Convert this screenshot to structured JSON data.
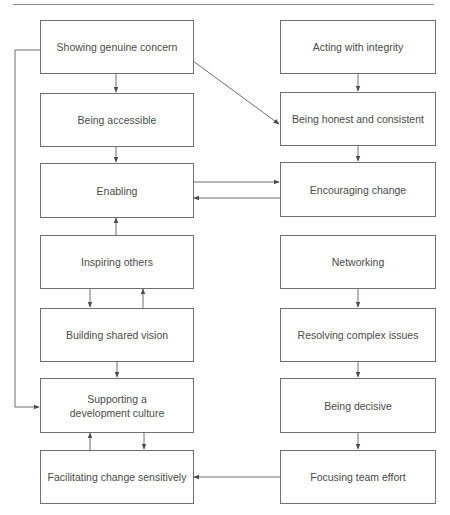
{
  "diagram": {
    "type": "flowchart",
    "colors": {
      "line": "#6f6f6f",
      "text": "#4a4a4a",
      "background": "#ffffff"
    },
    "left_column": [
      {
        "id": "L1",
        "label": "Showing genuine concern"
      },
      {
        "id": "L2",
        "label": "Being accessible"
      },
      {
        "id": "L3",
        "label": "Enabling"
      },
      {
        "id": "L4",
        "label": "Inspiring others"
      },
      {
        "id": "L5",
        "label": "Building shared vision"
      },
      {
        "id": "L6",
        "label": "Supporting a development culture"
      },
      {
        "id": "L7",
        "label": "Facilitating change sensitively"
      }
    ],
    "right_column": [
      {
        "id": "R1",
        "label": "Acting with integrity"
      },
      {
        "id": "R2",
        "label": "Being honest and consistent"
      },
      {
        "id": "R3",
        "label": "Encouraging change"
      },
      {
        "id": "R4",
        "label": "Networking"
      },
      {
        "id": "R5",
        "label": "Resolving complex issues"
      },
      {
        "id": "R6",
        "label": "Being decisive"
      },
      {
        "id": "R7",
        "label": "Focusing team effort"
      }
    ],
    "edges": [
      {
        "from": "L1",
        "to": "L2"
      },
      {
        "from": "L1",
        "to": "R2"
      },
      {
        "from": "L1",
        "to": "L6"
      },
      {
        "from": "L2",
        "to": "L3"
      },
      {
        "from": "L3",
        "to": "R3"
      },
      {
        "from": "R3",
        "to": "L3"
      },
      {
        "from": "L4",
        "to": "L3"
      },
      {
        "from": "L4",
        "to": "L5"
      },
      {
        "from": "L5",
        "to": "L4"
      },
      {
        "from": "L5",
        "to": "L6"
      },
      {
        "from": "L6",
        "to": "L7"
      },
      {
        "from": "L7",
        "to": "L6"
      },
      {
        "from": "R1",
        "to": "R2"
      },
      {
        "from": "R2",
        "to": "R3"
      },
      {
        "from": "R4",
        "to": "R5"
      },
      {
        "from": "R5",
        "to": "R6"
      },
      {
        "from": "R6",
        "to": "R7"
      },
      {
        "from": "R7",
        "to": "L7"
      }
    ]
  }
}
